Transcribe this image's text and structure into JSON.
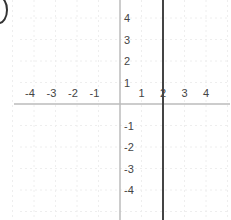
{
  "chart_data": {
    "type": "line",
    "title": "",
    "xlabel": "",
    "ylabel": "",
    "xlim": [
      -5,
      5
    ],
    "ylim": [
      -5,
      5
    ],
    "grid": true,
    "x_ticks": [
      "-4",
      "-3",
      "-2",
      "-1",
      "1",
      "2",
      "3",
      "4"
    ],
    "y_ticks": [
      "4",
      "3",
      "2",
      "1",
      "-1",
      "-2",
      "-3",
      "-4"
    ],
    "series": [
      {
        "name": "x = 2",
        "type": "vertical-line",
        "x": [
          2,
          2
        ],
        "y": [
          -5,
          5
        ]
      }
    ],
    "legend": null
  },
  "colors": {
    "axis": "#bbbbbb",
    "grid": "#eeeeee",
    "line": "#444444",
    "label": "#444444"
  },
  "option_marker": {
    "icon": "radio-circle-icon"
  }
}
